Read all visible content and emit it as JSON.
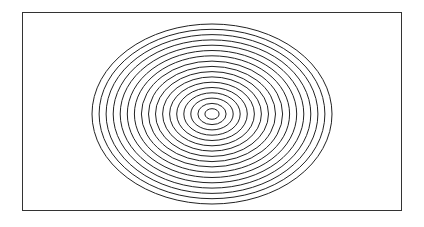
{
  "figure": {
    "ring_count": 17,
    "stroke_color": "#222222",
    "frame_color": "#333333",
    "background_color": "#ffffff"
  }
}
